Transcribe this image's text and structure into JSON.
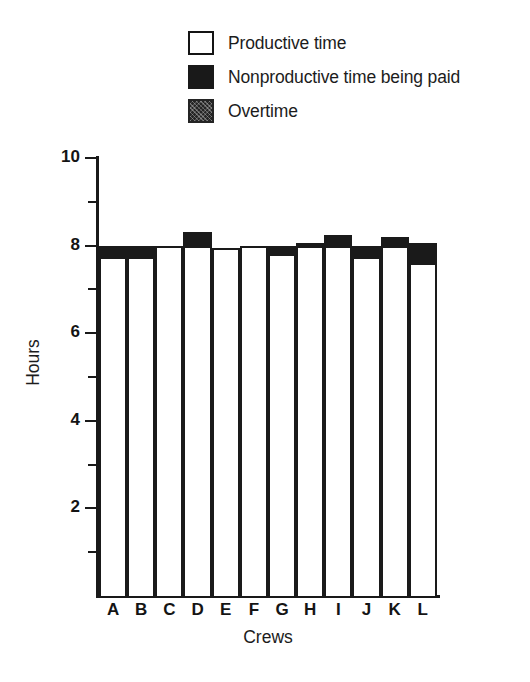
{
  "chart_data": {
    "type": "bar",
    "subtype": "stacked-bar",
    "title": "",
    "xlabel": "Crews",
    "ylabel": "Hours",
    "categories": [
      "A",
      "B",
      "C",
      "D",
      "E",
      "F",
      "G",
      "H",
      "I",
      "J",
      "K",
      "L"
    ],
    "ylim": [
      0,
      10
    ],
    "xlim_categories": 12,
    "y_major_ticks": [
      0,
      2,
      4,
      6,
      8,
      10
    ],
    "y_tick_labels": [
      "2",
      "4",
      "6",
      "8",
      "10"
    ],
    "y_minor_ticks": [
      1,
      3,
      5,
      7,
      9
    ],
    "grid": false,
    "legend_position": "top",
    "series": [
      {
        "name": "Productive time",
        "swatch": "open",
        "color": "#ffffff",
        "values": [
          7.75,
          7.75,
          8.0,
          8.0,
          7.95,
          8.0,
          7.8,
          8.0,
          8.0,
          7.75,
          8.0,
          7.6
        ]
      },
      {
        "name": "Nonproductive time being paid",
        "swatch": "solid",
        "color": "#1a1a1a",
        "values": [
          0.25,
          0.25,
          0.0,
          0.3,
          0.0,
          0.0,
          0.2,
          0.05,
          0.25,
          0.25,
          0.2,
          0.45
        ]
      },
      {
        "name": "Overtime",
        "swatch": "hatch",
        "color": "#262626",
        "values": [
          0.0,
          0.0,
          0.0,
          0.0,
          0.0,
          0.0,
          0.0,
          0.0,
          0.0,
          0.0,
          0.0,
          0.0
        ]
      }
    ],
    "totals": [
      8.0,
      8.0,
      8.0,
      8.3,
      7.95,
      8.0,
      8.0,
      8.05,
      8.25,
      8.0,
      8.2,
      8.05
    ]
  },
  "legend": {
    "items": [
      {
        "label": "Productive time",
        "swatch": "open"
      },
      {
        "label": "Nonproductive time being paid",
        "swatch": "solid"
      },
      {
        "label": "Overtime",
        "swatch": "hatch"
      }
    ]
  },
  "axes": {
    "y_title": "Hours",
    "x_title": "Crews",
    "y_labels": [
      "10",
      "8",
      "6",
      "4",
      "2"
    ],
    "x_labels": [
      "A",
      "B",
      "C",
      "D",
      "E",
      "F",
      "G",
      "H",
      "I",
      "J",
      "K",
      "L"
    ]
  },
  "colors": {
    "ink": "#1a1a1a",
    "productive": "#ffffff",
    "nonproductive": "#1a1a1a",
    "overtime": "#262626",
    "background": "#ffffff"
  }
}
